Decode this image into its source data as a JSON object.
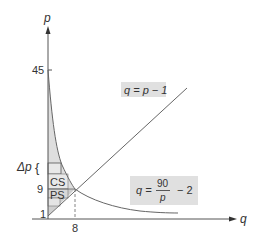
{
  "figure": {
    "y_axis_label": "p",
    "x_axis_label": "q",
    "y_ticks": [
      "45",
      "9",
      "1"
    ],
    "x_ticks": [
      "8"
    ],
    "delta_label": "Δp",
    "brace": "{",
    "cs_label": "CS",
    "ps_label": "PS",
    "supply_eq": "q = p − 1",
    "demand_eq_lhs": "q =",
    "demand_eq_num": "90",
    "demand_eq_den": "p",
    "demand_eq_rhs": "− 2",
    "colors": {
      "axis": "#555555",
      "curve": "#666666",
      "shade": "#dcdcdc",
      "label_box": "#e0e0e0",
      "text": "#333333"
    }
  }
}
